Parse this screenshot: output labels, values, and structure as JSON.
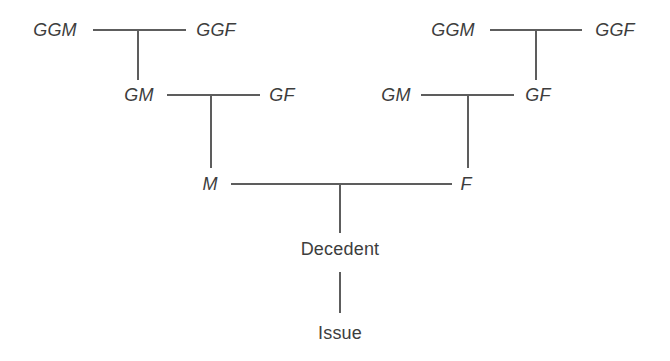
{
  "diagram": {
    "background_color": "#ffffff",
    "line_color": "#5d5d5d",
    "text_color": "#3d3d3d",
    "nodes": [
      {
        "id": "ggm-left",
        "label": "GGM",
        "style": "ancestor",
        "x": 55,
        "y": 30
      },
      {
        "id": "ggf-left",
        "label": "GGF",
        "style": "ancestor",
        "x": 216,
        "y": 30
      },
      {
        "id": "gm-left",
        "label": "GM",
        "style": "ancestor",
        "x": 139,
        "y": 95
      },
      {
        "id": "gf-left",
        "label": "GF",
        "style": "ancestor",
        "x": 282,
        "y": 95
      },
      {
        "id": "mother",
        "label": "M",
        "style": "ancestor",
        "x": 210,
        "y": 184
      },
      {
        "id": "ggm-right",
        "label": "GGM",
        "style": "ancestor",
        "x": 453,
        "y": 30
      },
      {
        "id": "ggf-right",
        "label": "GGF",
        "style": "ancestor",
        "x": 615,
        "y": 30
      },
      {
        "id": "gm-right",
        "label": "GM",
        "style": "ancestor",
        "x": 396,
        "y": 95
      },
      {
        "id": "gf-right",
        "label": "GF",
        "style": "ancestor",
        "x": 538,
        "y": 95
      },
      {
        "id": "father",
        "label": "F",
        "style": "ancestor",
        "x": 466,
        "y": 184
      },
      {
        "id": "decedent",
        "label": "Decedent",
        "style": "descendant",
        "x": 340,
        "y": 249
      },
      {
        "id": "issue",
        "label": "Issue",
        "style": "descendant",
        "x": 340,
        "y": 333
      }
    ],
    "connectors": [
      {
        "id": "ggm-ggf-left-bar",
        "orientation": "horizontal",
        "x1": 93,
        "y1": 30,
        "x2": 186,
        "y2": 30
      },
      {
        "id": "ggm-ggf-left-drop",
        "orientation": "vertical",
        "x1": 138,
        "y1": 30,
        "x2": 138,
        "y2": 80
      },
      {
        "id": "gm-gf-left-bar",
        "orientation": "horizontal",
        "x1": 167,
        "y1": 95,
        "x2": 260,
        "y2": 95
      },
      {
        "id": "gm-gf-left-drop",
        "orientation": "vertical",
        "x1": 211,
        "y1": 95,
        "x2": 211,
        "y2": 168
      },
      {
        "id": "ggm-ggf-right-bar",
        "orientation": "horizontal",
        "x1": 490,
        "y1": 30,
        "x2": 582,
        "y2": 30
      },
      {
        "id": "ggm-ggf-right-drop",
        "orientation": "vertical",
        "x1": 536,
        "y1": 30,
        "x2": 536,
        "y2": 80
      },
      {
        "id": "gm-gf-right-bar",
        "orientation": "horizontal",
        "x1": 421,
        "y1": 95,
        "x2": 514,
        "y2": 95
      },
      {
        "id": "gm-gf-right-drop",
        "orientation": "vertical",
        "x1": 468,
        "y1": 95,
        "x2": 468,
        "y2": 168
      },
      {
        "id": "mother-father-bar",
        "orientation": "horizontal",
        "x1": 231,
        "y1": 184,
        "x2": 452,
        "y2": 184
      },
      {
        "id": "decedent-drop",
        "orientation": "vertical",
        "x1": 340,
        "y1": 184,
        "x2": 340,
        "y2": 233
      },
      {
        "id": "issue-drop",
        "orientation": "vertical",
        "x1": 340,
        "y1": 272,
        "x2": 340,
        "y2": 313
      }
    ]
  }
}
